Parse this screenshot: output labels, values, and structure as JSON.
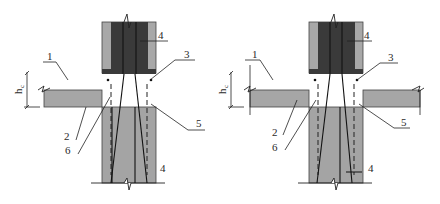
{
  "figure": {
    "type": "structural-joint-detail",
    "panels": [
      {
        "id": "left",
        "description": "Column joint with slab on one side",
        "labels": {
          "l1": "1",
          "l2": "2",
          "l3": "3",
          "l4_top": "4",
          "l4_bottom": "4",
          "l5": "5",
          "l6": "6"
        },
        "dimension": {
          "symbol": "h",
          "subscript": "c"
        }
      },
      {
        "id": "right",
        "description": "Column joint with slabs on both sides",
        "labels": {
          "l1": "1",
          "l2": "2",
          "l3": "3",
          "l4_top": "4",
          "l4_bottom": "4",
          "l5": "5",
          "l6": "6"
        },
        "dimension": {
          "symbol": "h",
          "subscript": "c"
        }
      }
    ],
    "colors": {
      "background": "#ffffff",
      "column_core_dark": "#3a3a3a",
      "column_shell_light": "#a8a8a8",
      "lower_column": "#a4a4a4",
      "slab": "#a6a6a6",
      "line": "#222222"
    }
  }
}
